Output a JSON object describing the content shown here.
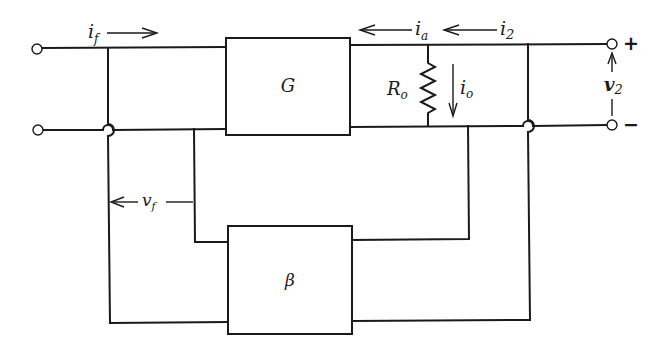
{
  "diagram": {
    "type": "feedback amplifier block diagram",
    "blocks": {
      "forward": {
        "label": "G"
      },
      "feedback": {
        "label": "β"
      }
    },
    "labels": {
      "input_current": {
        "main": "i",
        "sub": "f"
      },
      "amplifier_current": {
        "main": "i",
        "sub": "a"
      },
      "output_current": {
        "main": "i",
        "sub": "2"
      },
      "resistor": {
        "main": "R",
        "sub": "o"
      },
      "resistor_current": {
        "main": "i",
        "sub": "o"
      },
      "output_voltage": {
        "main": "v",
        "sub": "2"
      },
      "feedback_voltage": {
        "main": "v",
        "sub": "f"
      }
    },
    "terminals": {
      "plus": "+",
      "minus": "−"
    },
    "colors": {
      "ink": "#1a1a1a",
      "background": "#ffffff"
    }
  }
}
